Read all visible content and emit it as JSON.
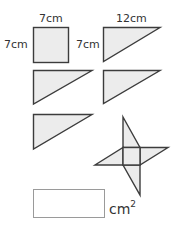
{
  "colors": {
    "shape_fill": "#ececec",
    "stroke": "#3c3c3c",
    "answer_border": "#9a9a9a"
  },
  "labels": {
    "square_top": "7cm",
    "square_left": "7cm",
    "triangle_left": "7cm",
    "triangle_top": "12cm"
  },
  "shapes": {
    "square": {
      "side": "7cm"
    },
    "triangle": {
      "base": "12cm",
      "height": "7cm",
      "count": 4
    },
    "pinwheel": {
      "description": "square with four triangles attached"
    }
  },
  "answer": {
    "value": "",
    "unit": "cm",
    "unit_exponent": "2"
  }
}
